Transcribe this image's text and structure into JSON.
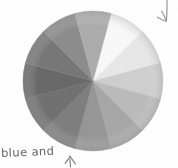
{
  "page": {
    "background_color": "#fefefe",
    "width": 178,
    "height": 168
  },
  "annotations": {
    "note_text": "blue and",
    "note_color": "#4a4a4a",
    "bottom_arrow": {
      "name": "up-arrow",
      "direction": "up",
      "target": "bottom segment of color wheel"
    },
    "top_arrow": {
      "name": "down-arrow",
      "direction": "down-left",
      "target": "upper-right segment of color wheel"
    }
  },
  "chart_data": {
    "type": "pie",
    "title": "",
    "subtitle": "",
    "xlabel": "",
    "ylabel": "",
    "legend_position": "none",
    "grid": false,
    "segment_count": 12,
    "equal_segments": true,
    "start_angle_deg": -75,
    "segment_sweep_deg": 30,
    "center": {
      "cx": 93,
      "cy": 81
    },
    "radius": 70,
    "categories": [
      "segment-1",
      "segment-2",
      "segment-3",
      "segment-4",
      "segment-5",
      "segment-6",
      "segment-7",
      "segment-8",
      "segment-9",
      "segment-10",
      "segment-11",
      "segment-12"
    ],
    "values": [
      8.33,
      8.33,
      8.33,
      8.33,
      8.33,
      8.33,
      8.33,
      8.33,
      8.33,
      8.33,
      8.33,
      8.33
    ],
    "series": [
      {
        "name": "grayscale-value",
        "values": [
          248,
          231,
          206,
          186,
          166,
          150,
          126,
          112,
          104,
          118,
          140,
          171
        ]
      }
    ],
    "colors": [
      "#f8f8f8",
      "#e7e7e7",
      "#cecece",
      "#bababa",
      "#a6a6a6",
      "#969696",
      "#7e7e7e",
      "#707070",
      "#686868",
      "#767676",
      "#8c8c8c",
      "#ababab"
    ]
  }
}
